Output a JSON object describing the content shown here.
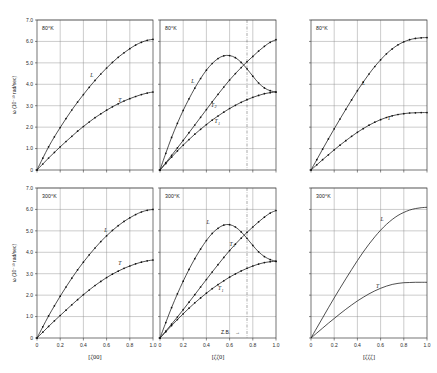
{
  "figure": {
    "y_axis_label": "ω (10⁻¹³ rad/sec)",
    "y_ticks": [
      "0",
      "1.0",
      "2.0",
      "3.0",
      "4.0",
      "5.0",
      "6.0",
      "7.0"
    ],
    "y_tick_values": [
      0,
      1.0,
      2.0,
      3.0,
      4.0,
      5.0,
      6.0,
      7.0
    ],
    "x_ticks": [
      "0",
      "0.2",
      "0.4",
      "0.6",
      "0.8",
      "1.0"
    ],
    "x_tick_values": [
      0,
      0.2,
      0.4,
      0.6,
      0.8,
      1.0
    ],
    "zone_boundary_label": "Z.B.",
    "zone_boundary_arrow": "→",
    "zone_boundary_x": 0.75,
    "colors": {
      "curve": "#151515",
      "grid": "#8e8e8e",
      "frame": "#3a3a3a",
      "marker": "#111111"
    }
  },
  "chart_data": {
    "type": "line",
    "ylabel": "ω (10⁻¹³ rad/sec)",
    "ylim": [
      0,
      7.0
    ],
    "xlim": [
      0,
      1.0
    ],
    "grid": true,
    "legend": "inline branch labels",
    "panels": [
      {
        "row": 0,
        "col": 0,
        "temperature": "80°K",
        "xlabel": "[ζ00]",
        "markers": true,
        "series": [
          {
            "name": "L",
            "label_x": 0.46,
            "label_y": 4.35,
            "x": [
              0,
              0.05,
              0.1,
              0.15,
              0.2,
              0.25,
              0.3,
              0.35,
              0.4,
              0.45,
              0.5,
              0.55,
              0.6,
              0.65,
              0.7,
              0.75,
              0.8,
              0.85,
              0.9,
              0.95,
              1.0
            ],
            "y": [
              0,
              0.55,
              1.08,
              1.55,
              1.98,
              2.4,
              2.8,
              3.17,
              3.52,
              3.86,
              4.18,
              4.48,
              4.76,
              5.02,
              5.26,
              5.47,
              5.66,
              5.83,
              5.96,
              6.05,
              6.1
            ]
          },
          {
            "name": "T",
            "label_x": 0.7,
            "label_y": 3.18,
            "x": [
              0,
              0.05,
              0.1,
              0.15,
              0.2,
              0.25,
              0.3,
              0.35,
              0.4,
              0.45,
              0.5,
              0.55,
              0.6,
              0.65,
              0.7,
              0.75,
              0.8,
              0.85,
              0.9,
              0.95,
              1.0
            ],
            "y": [
              0,
              0.28,
              0.56,
              0.82,
              1.08,
              1.33,
              1.57,
              1.81,
              2.03,
              2.24,
              2.44,
              2.62,
              2.79,
              2.95,
              3.09,
              3.22,
              3.33,
              3.43,
              3.52,
              3.59,
              3.64
            ]
          }
        ]
      },
      {
        "row": 0,
        "col": 1,
        "temperature": "80°K",
        "xlabel": "[ζζ0]",
        "markers": true,
        "zone_boundary": 0.75,
        "series": [
          {
            "name": "L",
            "label_x": 0.27,
            "label_y": 4.05,
            "x": [
              0,
              0.05,
              0.1,
              0.15,
              0.2,
              0.25,
              0.3,
              0.35,
              0.4,
              0.45,
              0.5,
              0.55,
              0.6,
              0.65,
              0.7,
              0.75,
              0.8,
              0.85,
              0.9,
              0.95,
              1.0
            ],
            "y": [
              0,
              0.78,
              1.52,
              2.18,
              2.78,
              3.32,
              3.82,
              4.27,
              4.66,
              4.97,
              5.2,
              5.33,
              5.34,
              5.24,
              5.02,
              4.72,
              4.38,
              4.06,
              3.83,
              3.7,
              3.64
            ]
          },
          {
            "name": "T2",
            "label_x": 0.44,
            "label_y": 2.95,
            "x": [
              0,
              0.05,
              0.1,
              0.15,
              0.2,
              0.25,
              0.3,
              0.35,
              0.4,
              0.45,
              0.5,
              0.55,
              0.6,
              0.65,
              0.7,
              0.75,
              0.8,
              0.85,
              0.9,
              0.95,
              1.0
            ],
            "y": [
              0,
              0.34,
              0.68,
              1.03,
              1.38,
              1.74,
              2.1,
              2.46,
              2.82,
              3.18,
              3.53,
              3.87,
              4.2,
              4.5,
              4.78,
              5.05,
              5.3,
              5.55,
              5.77,
              5.96,
              6.08
            ]
          },
          {
            "name": "T1",
            "label_x": 0.47,
            "label_y": 2.18,
            "x": [
              0,
              0.05,
              0.1,
              0.15,
              0.2,
              0.25,
              0.3,
              0.35,
              0.4,
              0.45,
              0.5,
              0.55,
              0.6,
              0.65,
              0.7,
              0.75,
              0.8,
              0.85,
              0.9,
              0.95,
              1.0
            ],
            "y": [
              0,
              0.3,
              0.6,
              0.89,
              1.16,
              1.42,
              1.67,
              1.9,
              2.12,
              2.33,
              2.52,
              2.7,
              2.87,
              3.02,
              3.16,
              3.28,
              3.39,
              3.48,
              3.56,
              3.61,
              3.64
            ]
          }
        ]
      },
      {
        "row": 0,
        "col": 2,
        "temperature": "80°K",
        "xlabel": "[ζζζ]",
        "markers": true,
        "series": [
          {
            "name": "L",
            "label_x": 0.44,
            "label_y": 3.95,
            "x": [
              0,
              0.05,
              0.1,
              0.15,
              0.2,
              0.25,
              0.3,
              0.35,
              0.4,
              0.45,
              0.5,
              0.55,
              0.6,
              0.65,
              0.7,
              0.75,
              0.8,
              0.85,
              0.9,
              0.95,
              1.0
            ],
            "y": [
              0,
              0.48,
              0.97,
              1.45,
              1.92,
              2.38,
              2.83,
              3.27,
              3.7,
              4.1,
              4.48,
              4.83,
              5.14,
              5.42,
              5.65,
              5.84,
              5.98,
              6.08,
              6.14,
              6.17,
              6.18
            ]
          },
          {
            "name": "T",
            "label_x": 0.66,
            "label_y": 2.34,
            "x": [
              0,
              0.05,
              0.1,
              0.15,
              0.2,
              0.25,
              0.3,
              0.35,
              0.4,
              0.45,
              0.5,
              0.55,
              0.6,
              0.65,
              0.7,
              0.75,
              0.8,
              0.85,
              0.9,
              0.95,
              1.0
            ],
            "y": [
              0,
              0.24,
              0.48,
              0.71,
              0.94,
              1.16,
              1.37,
              1.57,
              1.76,
              1.93,
              2.09,
              2.23,
              2.35,
              2.45,
              2.53,
              2.59,
              2.63,
              2.66,
              2.67,
              2.68,
              2.68
            ]
          }
        ]
      },
      {
        "row": 1,
        "col": 0,
        "temperature": "300°K",
        "xlabel": "[ζ00]",
        "markers": true,
        "series": [
          {
            "name": "L",
            "label_x": 0.58,
            "label_y": 4.95,
            "x": [
              0,
              0.05,
              0.1,
              0.15,
              0.2,
              0.25,
              0.3,
              0.35,
              0.4,
              0.45,
              0.5,
              0.55,
              0.6,
              0.65,
              0.7,
              0.75,
              0.8,
              0.85,
              0.9,
              0.95,
              1.0
            ],
            "y": [
              0,
              0.52,
              1.03,
              1.5,
              1.95,
              2.38,
              2.79,
              3.18,
              3.54,
              3.88,
              4.2,
              4.5,
              4.77,
              5.02,
              5.24,
              5.44,
              5.61,
              5.76,
              5.88,
              5.96,
              6.0
            ]
          },
          {
            "name": "T",
            "label_x": 0.7,
            "label_y": 3.42,
            "x": [
              0,
              0.05,
              0.1,
              0.15,
              0.2,
              0.25,
              0.3,
              0.35,
              0.4,
              0.45,
              0.5,
              0.55,
              0.6,
              0.65,
              0.7,
              0.75,
              0.8,
              0.85,
              0.9,
              0.95,
              1.0
            ],
            "y": [
              0,
              0.27,
              0.54,
              0.8,
              1.05,
              1.3,
              1.55,
              1.79,
              2.02,
              2.24,
              2.45,
              2.64,
              2.82,
              2.98,
              3.12,
              3.25,
              3.36,
              3.46,
              3.54,
              3.6,
              3.64
            ]
          }
        ]
      },
      {
        "row": 1,
        "col": 1,
        "temperature": "300°K",
        "xlabel": "[ζζ0]",
        "markers": true,
        "zone_boundary": 0.75,
        "series": [
          {
            "name": "L",
            "label_x": 0.4,
            "label_y": 5.3,
            "x": [
              0,
              0.05,
              0.1,
              0.15,
              0.2,
              0.25,
              0.3,
              0.35,
              0.4,
              0.45,
              0.5,
              0.55,
              0.6,
              0.65,
              0.7,
              0.75,
              0.8,
              0.85,
              0.9,
              0.95,
              1.0
            ],
            "y": [
              0,
              0.72,
              1.42,
              2.06,
              2.65,
              3.2,
              3.7,
              4.15,
              4.55,
              4.88,
              5.12,
              5.27,
              5.29,
              5.18,
              4.95,
              4.65,
              4.32,
              4.02,
              3.8,
              3.66,
              3.58
            ]
          },
          {
            "name": "T2",
            "label_x": 0.6,
            "label_y": 4.3,
            "x": [
              0,
              0.05,
              0.1,
              0.15,
              0.2,
              0.25,
              0.3,
              0.35,
              0.4,
              0.45,
              0.5,
              0.55,
              0.6,
              0.65,
              0.7,
              0.75,
              0.8,
              0.85,
              0.9,
              0.95,
              1.0
            ],
            "y": [
              0,
              0.32,
              0.65,
              0.98,
              1.32,
              1.67,
              2.02,
              2.38,
              2.73,
              3.08,
              3.42,
              3.76,
              4.08,
              4.38,
              4.66,
              4.93,
              5.18,
              5.42,
              5.64,
              5.83,
              5.95
            ]
          },
          {
            "name": "T1",
            "label_x": 0.5,
            "label_y": 2.22,
            "x": [
              0,
              0.05,
              0.1,
              0.15,
              0.2,
              0.25,
              0.3,
              0.35,
              0.4,
              0.45,
              0.5,
              0.55,
              0.6,
              0.65,
              0.7,
              0.75,
              0.8,
              0.85,
              0.9,
              0.95,
              1.0
            ],
            "y": [
              0,
              0.29,
              0.58,
              0.86,
              1.13,
              1.39,
              1.64,
              1.87,
              2.09,
              2.3,
              2.49,
              2.67,
              2.84,
              2.99,
              3.13,
              3.25,
              3.36,
              3.45,
              3.52,
              3.56,
              3.58
            ]
          }
        ]
      },
      {
        "row": 1,
        "col": 2,
        "temperature": "300°K",
        "xlabel": "[ζζζ]",
        "markers": false,
        "series": [
          {
            "name": "L",
            "label_x": 0.6,
            "label_y": 5.48,
            "x": [
              0,
              0.05,
              0.1,
              0.15,
              0.2,
              0.25,
              0.3,
              0.35,
              0.4,
              0.45,
              0.5,
              0.55,
              0.6,
              0.65,
              0.7,
              0.75,
              0.8,
              0.85,
              0.9,
              0.95,
              1.0
            ],
            "y": [
              0,
              0.47,
              0.94,
              1.41,
              1.87,
              2.32,
              2.76,
              3.19,
              3.61,
              4.01,
              4.38,
              4.72,
              5.03,
              5.3,
              5.53,
              5.72,
              5.86,
              5.97,
              6.04,
              6.08,
              6.1
            ]
          },
          {
            "name": "T",
            "label_x": 0.56,
            "label_y": 2.34,
            "x": [
              0,
              0.05,
              0.1,
              0.15,
              0.2,
              0.25,
              0.3,
              0.35,
              0.4,
              0.45,
              0.5,
              0.55,
              0.6,
              0.65,
              0.7,
              0.75,
              0.8,
              0.85,
              0.9,
              0.95,
              1.0
            ],
            "y": [
              0,
              0.23,
              0.46,
              0.69,
              0.91,
              1.13,
              1.34,
              1.54,
              1.73,
              1.9,
              2.06,
              2.2,
              2.32,
              2.42,
              2.5,
              2.55,
              2.58,
              2.59,
              2.6,
              2.6,
              2.6
            ]
          }
        ]
      }
    ]
  }
}
